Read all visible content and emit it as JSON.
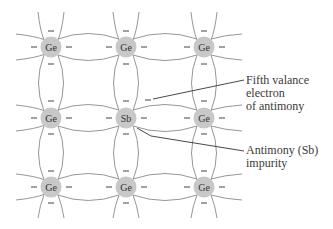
{
  "diagram": {
    "atoms": [
      {
        "label": "Ge",
        "row": 0,
        "col": 0
      },
      {
        "label": "Ge",
        "row": 0,
        "col": 1
      },
      {
        "label": "Ge",
        "row": 0,
        "col": 2
      },
      {
        "label": "Ge",
        "row": 1,
        "col": 0
      },
      {
        "label": "Sb",
        "row": 1,
        "col": 1
      },
      {
        "label": "Ge",
        "row": 1,
        "col": 2
      },
      {
        "label": "Ge",
        "row": 2,
        "col": 0
      },
      {
        "label": "Ge",
        "row": 2,
        "col": 1
      },
      {
        "label": "Ge",
        "row": 2,
        "col": 2
      }
    ],
    "electron_symbol": "–",
    "callouts": {
      "fifth_electron": {
        "lines": [
          "Fifth valance",
          "electron",
          "of antimony"
        ]
      },
      "impurity": {
        "lines": [
          "Antimony (Sb)",
          "impurity"
        ]
      }
    },
    "colors": {
      "atom_fill": "#c8c8c8",
      "bond_line": "#8a8a8a",
      "leader_line": "#333333",
      "text": "#333333"
    }
  }
}
